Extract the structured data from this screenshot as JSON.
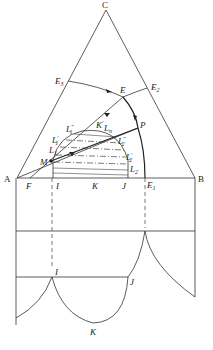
{
  "diagram": {
    "type": "ternary-phase-diagram-with-projection",
    "vertices": {
      "top": "C",
      "left": "A",
      "right": "B"
    },
    "points": {
      "E": "E",
      "E1": "E",
      "E1_sub": "1",
      "E2": "E",
      "E2_sub": "2",
      "E3": "E",
      "E3_sub": "3",
      "P": "P",
      "M": "M",
      "F": "F",
      "I": "I",
      "K": "K",
      "J": "J",
      "L1": "L",
      "L1_sub": "1",
      "L1p": "L",
      "L1p_sub": "1",
      "L1p_sup": "′",
      "L1pp": "L",
      "L1pp_sub": "1",
      "L1pp_sup": "″",
      "K1p": "K",
      "K1p_sup": "′",
      "Ln": "L",
      "Ln_sub": "n",
      "L2": "L",
      "L2_sub": "2",
      "L2p": "L",
      "L2p_sub": "2",
      "L2p_sup": "′",
      "L2pp": "L",
      "L2pp_sub": "2",
      "L2pp_sup": "″"
    },
    "lower_view_points": {
      "I": "I",
      "J": "J",
      "K": "K"
    },
    "colors": {
      "line": "#333333",
      "background": "#ffffff"
    }
  }
}
